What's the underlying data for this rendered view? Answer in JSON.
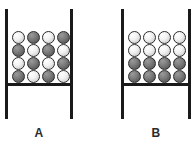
{
  "figure": {
    "width": 194,
    "height": 146,
    "background_color": "#ffffff",
    "line_color": "#1a1a1a",
    "ball_light_color": "#f2f2f2",
    "ball_dark_color": "#6b6b6b",
    "ball_outline_color": "#2b2b2b",
    "ball_diameter": 13,
    "columns_per_container": 4,
    "rows_per_container": 4
  },
  "containers": [
    {
      "id": "A",
      "label": "A",
      "left": 5,
      "width": 68,
      "wall_top": 9,
      "wall_height": 110,
      "shelf_top": 83,
      "arrangement": "checkerboard",
      "column_x": [
        7,
        22,
        37,
        52
      ],
      "row_y": [
        -52,
        -39,
        -26,
        -13
      ],
      "grid": [
        [
          "light",
          "dark",
          "light",
          "dark"
        ],
        [
          "dark",
          "light",
          "dark",
          "light"
        ],
        [
          "light",
          "dark",
          "light",
          "dark"
        ],
        [
          "dark",
          "light",
          "dark",
          "light"
        ]
      ],
      "counts": {
        "light": 8,
        "dark": 8,
        "total": 16
      }
    },
    {
      "id": "B",
      "label": "B",
      "left": 121,
      "width": 70,
      "wall_top": 9,
      "wall_height": 110,
      "shelf_top": 83,
      "arrangement": "layered",
      "column_x": [
        7,
        22,
        37,
        52
      ],
      "row_y": [
        -52,
        -39,
        -26,
        -13
      ],
      "grid": [
        [
          "light",
          "light",
          "light",
          "light"
        ],
        [
          "light",
          "light",
          "light",
          "light"
        ],
        [
          "dark",
          "dark",
          "dark",
          "dark"
        ],
        [
          "dark",
          "dark",
          "dark",
          "dark"
        ]
      ],
      "counts": {
        "light": 8,
        "dark": 8,
        "total": 16
      }
    }
  ]
}
